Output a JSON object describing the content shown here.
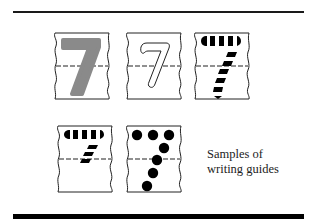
{
  "figure": {
    "caption_line1": "Samples of",
    "caption_line2": "writing guides",
    "digit": "7",
    "colors": {
      "rule": "#1a1a1a",
      "solid_gray": "#8a8a8a",
      "ink": "#000000",
      "paper": "#ffffff"
    },
    "cards": [
      {
        "id": "solid-gray",
        "style": "solid gray filled digit 7"
      },
      {
        "id": "outline",
        "style": "outlined digit 7"
      },
      {
        "id": "dashed-full",
        "style": "full dashed-stroke digit 7"
      },
      {
        "id": "dashed-partial",
        "style": "partial dashed-stroke digit 7"
      },
      {
        "id": "dotted",
        "style": "dotted digit 7"
      }
    ]
  }
}
